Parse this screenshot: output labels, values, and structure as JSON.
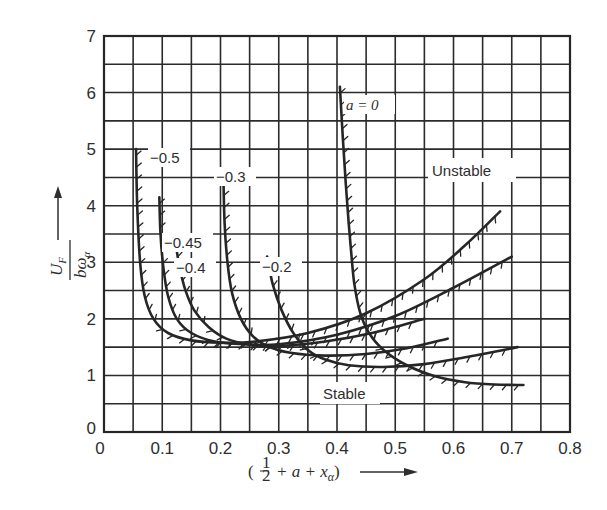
{
  "chart_data": {
    "type": "line",
    "title": "",
    "xlabel": "( 1/2 + a + x_α )",
    "ylabel": "U_F / (b ω_α)",
    "xlim": [
      0,
      0.8
    ],
    "ylim": [
      0,
      7
    ],
    "x_ticks": [
      "0",
      "0.1",
      "0.2",
      "0.3",
      "0.4",
      "0.5",
      "0.6",
      "0.7",
      "0.8"
    ],
    "y_ticks": [
      "0",
      "1",
      "2",
      "3",
      "4",
      "5",
      "6",
      "7"
    ],
    "grid": true,
    "grid_step": {
      "x": 0.05,
      "y": 0.5
    },
    "annotations": [
      "Unstable",
      "Stable"
    ],
    "hatch_side": "stable side of each boundary",
    "series": [
      {
        "name": "a = -0.5",
        "label": "−0.5",
        "x": [
          0.055,
          0.057,
          0.062,
          0.07,
          0.085,
          0.11,
          0.15,
          0.2,
          0.26,
          0.35,
          0.45,
          0.55,
          0.62,
          0.68
        ],
        "y": [
          5.0,
          4.0,
          3.0,
          2.4,
          2.0,
          1.75,
          1.62,
          1.58,
          1.6,
          1.75,
          2.1,
          2.7,
          3.3,
          3.9
        ]
      },
      {
        "name": "a = -0.45",
        "label": "−0.45",
        "x": [
          0.095,
          0.097,
          0.102,
          0.11,
          0.125,
          0.15,
          0.19,
          0.24,
          0.3,
          0.4,
          0.5,
          0.6,
          0.7
        ],
        "y": [
          4.15,
          3.5,
          2.9,
          2.4,
          2.0,
          1.75,
          1.6,
          1.55,
          1.55,
          1.72,
          2.05,
          2.55,
          3.1
        ]
      },
      {
        "name": "a = -0.4",
        "label": "−0.4",
        "x": [
          0.125,
          0.13,
          0.14,
          0.155,
          0.18,
          0.21,
          0.25,
          0.3,
          0.38,
          0.46,
          0.55
        ],
        "y": [
          3.2,
          2.9,
          2.5,
          2.15,
          1.85,
          1.65,
          1.55,
          1.52,
          1.6,
          1.75,
          2.0
        ]
      },
      {
        "name": "a = -0.3",
        "label": "−0.3",
        "x": [
          0.205,
          0.207,
          0.212,
          0.22,
          0.235,
          0.255,
          0.28,
          0.32,
          0.38,
          0.45,
          0.52,
          0.59
        ],
        "y": [
          4.5,
          3.7,
          3.0,
          2.45,
          2.0,
          1.7,
          1.52,
          1.4,
          1.35,
          1.38,
          1.48,
          1.65
        ]
      },
      {
        "name": "a = -0.2",
        "label": "−0.2",
        "x": [
          0.28,
          0.29,
          0.305,
          0.325,
          0.35,
          0.38,
          0.42,
          0.48,
          0.55,
          0.62,
          0.71
        ],
        "y": [
          3.1,
          2.6,
          2.15,
          1.75,
          1.45,
          1.28,
          1.18,
          1.15,
          1.2,
          1.32,
          1.5
        ]
      },
      {
        "name": "a = 0",
        "label": "a = 0",
        "x": [
          0.405,
          0.41,
          0.415,
          0.42,
          0.425,
          0.43,
          0.44,
          0.455,
          0.48,
          0.52,
          0.57,
          0.62,
          0.67,
          0.72
        ],
        "y": [
          6.1,
          5.2,
          4.4,
          3.7,
          3.1,
          2.6,
          2.1,
          1.75,
          1.45,
          1.18,
          0.98,
          0.88,
          0.84,
          0.83
        ]
      }
    ]
  },
  "labels": {
    "unstable": "Unstable",
    "stable": "Stable",
    "ylabel_num": "U",
    "ylabel_num_sub": "F",
    "ylabel_den": "bω",
    "ylabel_den_sub": "α",
    "xlabel_open": "(",
    "xlabel_half_num": "1",
    "xlabel_half_den": "2",
    "xlabel_rest": "+ a + x",
    "xlabel_sub": "α",
    "xlabel_close": ")"
  },
  "colors": {
    "ink": "#262626",
    "background": "#ffffff"
  }
}
